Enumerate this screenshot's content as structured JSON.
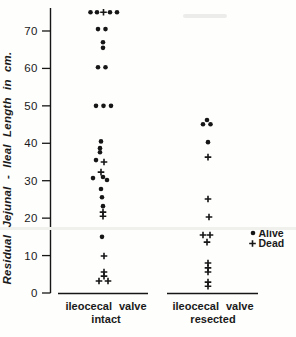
{
  "figure_title": "scatter plot of residual jejunal-ileal length by ileocecal valve status",
  "chart_data": {
    "type": "scatter",
    "title": "",
    "xlabel": "",
    "ylabel": "Residual Jejunal - Ileal Length in cm.",
    "ylim": [
      0,
      76
    ],
    "yticks": [
      0,
      10,
      20,
      30,
      40,
      50,
      60,
      70
    ],
    "grid": false,
    "legend_position": "right",
    "legend": [
      {
        "marker": "dot",
        "label": "Alive"
      },
      {
        "marker": "plus",
        "label": "Dead"
      }
    ],
    "groups": [
      {
        "id": "intact",
        "label_line1": "ileocecal valve",
        "label_line2": "intact",
        "label_center_x": 106,
        "baseline_x1": 58,
        "baseline_x2": 148
      },
      {
        "id": "resected",
        "label_line1": "ileocecal valve",
        "label_line2": "resected",
        "label_center_x": 213,
        "baseline_x1": 167,
        "baseline_x2": 258
      }
    ],
    "points": [
      {
        "group": "intact",
        "cm": 75,
        "status": "alive",
        "x": 90.5
      },
      {
        "group": "intact",
        "cm": 75,
        "status": "alive",
        "x": 97
      },
      {
        "group": "intact",
        "cm": 75,
        "status": "dead",
        "x": 103.5
      },
      {
        "group": "intact",
        "cm": 75,
        "status": "alive",
        "x": 110
      },
      {
        "group": "intact",
        "cm": 75,
        "status": "alive",
        "x": 117
      },
      {
        "group": "intact",
        "cm": 70.5,
        "status": "alive",
        "x": 98
      },
      {
        "group": "intact",
        "cm": 70.5,
        "status": "alive",
        "x": 105.5
      },
      {
        "group": "intact",
        "cm": 67,
        "status": "alive",
        "x": 103
      },
      {
        "group": "intact",
        "cm": 65.5,
        "status": "alive",
        "x": 103
      },
      {
        "group": "intact",
        "cm": 60.3,
        "status": "alive",
        "x": 98
      },
      {
        "group": "intact",
        "cm": 60.3,
        "status": "alive",
        "x": 105.5
      },
      {
        "group": "intact",
        "cm": 50,
        "status": "alive",
        "x": 96
      },
      {
        "group": "intact",
        "cm": 50,
        "status": "alive",
        "x": 103.5
      },
      {
        "group": "intact",
        "cm": 50,
        "status": "alive",
        "x": 111
      },
      {
        "group": "intact",
        "cm": 40.5,
        "status": "alive",
        "x": 101
      },
      {
        "group": "intact",
        "cm": 38.7,
        "status": "alive",
        "x": 100
      },
      {
        "group": "intact",
        "cm": 37.6,
        "status": "alive",
        "x": 100
      },
      {
        "group": "intact",
        "cm": 35.5,
        "status": "alive",
        "x": 96
      },
      {
        "group": "intact",
        "cm": 35,
        "status": "dead",
        "x": 104
      },
      {
        "group": "intact",
        "cm": 32.3,
        "status": "dead",
        "x": 101
      },
      {
        "group": "intact",
        "cm": 31,
        "status": "alive",
        "x": 103
      },
      {
        "group": "intact",
        "cm": 30.7,
        "status": "alive",
        "x": 93
      },
      {
        "group": "intact",
        "cm": 30.2,
        "status": "alive",
        "x": 107
      },
      {
        "group": "intact",
        "cm": 27.8,
        "status": "alive",
        "x": 101
      },
      {
        "group": "intact",
        "cm": 25.6,
        "status": "alive",
        "x": 102
      },
      {
        "group": "intact",
        "cm": 23.2,
        "status": "alive",
        "x": 103
      },
      {
        "group": "intact",
        "cm": 21.6,
        "status": "dead",
        "x": 103
      },
      {
        "group": "intact",
        "cm": 20.5,
        "status": "dead",
        "x": 103
      },
      {
        "group": "intact",
        "cm": 15,
        "status": "alive",
        "x": 102
      },
      {
        "group": "intact",
        "cm": 9.9,
        "status": "dead",
        "x": 104
      },
      {
        "group": "intact",
        "cm": 5.6,
        "status": "dead",
        "x": 104
      },
      {
        "group": "intact",
        "cm": 4.5,
        "status": "dead",
        "x": 104
      },
      {
        "group": "intact",
        "cm": 3.2,
        "status": "dead",
        "x": 99
      },
      {
        "group": "intact",
        "cm": 3.2,
        "status": "dead",
        "x": 108
      },
      {
        "group": "resected",
        "cm": 46.2,
        "status": "alive",
        "x": 207
      },
      {
        "group": "resected",
        "cm": 45.1,
        "status": "alive",
        "x": 203
      },
      {
        "group": "resected",
        "cm": 45.1,
        "status": "alive",
        "x": 210.5
      },
      {
        "group": "resected",
        "cm": 40.3,
        "status": "alive",
        "x": 208
      },
      {
        "group": "resected",
        "cm": 36.3,
        "status": "dead",
        "x": 208
      },
      {
        "group": "resected",
        "cm": 25.1,
        "status": "dead",
        "x": 208
      },
      {
        "group": "resected",
        "cm": 20.3,
        "status": "dead",
        "x": 209
      },
      {
        "group": "resected",
        "cm": 15.5,
        "status": "dead",
        "x": 203
      },
      {
        "group": "resected",
        "cm": 15.5,
        "status": "dead",
        "x": 210
      },
      {
        "group": "resected",
        "cm": 13.6,
        "status": "dead",
        "x": 207
      },
      {
        "group": "resected",
        "cm": 8,
        "status": "dead",
        "x": 208
      },
      {
        "group": "resected",
        "cm": 6.7,
        "status": "dead",
        "x": 208
      },
      {
        "group": "resected",
        "cm": 5.6,
        "status": "dead",
        "x": 208
      },
      {
        "group": "resected",
        "cm": 2.9,
        "status": "dead",
        "x": 208
      },
      {
        "group": "resected",
        "cm": 1.8,
        "status": "dead",
        "x": 208
      }
    ],
    "marker_color": "#161616",
    "legend_x": 250,
    "legend_y": 229
  }
}
